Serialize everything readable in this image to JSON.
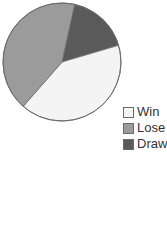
{
  "chart_data": {
    "type": "pie",
    "title": "",
    "slices": [
      {
        "label": "Win",
        "value": 41,
        "color": "#f4f4f4"
      },
      {
        "label": "Lose",
        "value": 42,
        "color": "#9b9b9b"
      },
      {
        "label": "Draw",
        "value": 17,
        "color": "#5a5a5a"
      }
    ],
    "start_label": "Draw",
    "legend_position": "bottom-right",
    "edge_color": "#6a6a6a"
  },
  "legend": {
    "items": [
      {
        "label": "Win",
        "color": "#f4f4f4"
      },
      {
        "label": "Lose",
        "color": "#9b9b9b"
      },
      {
        "label": "Draw",
        "color": "#5a5a5a"
      }
    ]
  }
}
